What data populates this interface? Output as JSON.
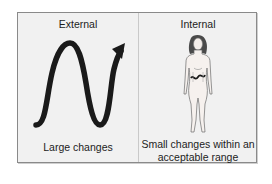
{
  "diagram": {
    "panels": [
      {
        "title": "External",
        "graphic": "wave-arrow-icon",
        "caption": "Large changes"
      },
      {
        "title": "Internal",
        "graphic": "human-figure-icon",
        "caption_lines": [
          "Small changes within an",
          "acceptable range"
        ]
      }
    ],
    "colors": {
      "background": "#f1f1f1",
      "border": "#8a8a8a",
      "stroke": "#1a1a1a"
    }
  }
}
